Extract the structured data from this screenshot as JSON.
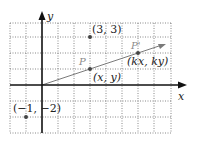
{
  "diagram": {
    "type": "coordinate-plane",
    "axes": {
      "x_label": "x",
      "y_label": "y"
    },
    "grid": {
      "x_range": [
        -2,
        8
      ],
      "y_range": [
        -3,
        4
      ],
      "style": "dotted"
    },
    "points": [
      {
        "name": "point-3-3",
        "coords": [
          3,
          3
        ],
        "label": "(3, 3)"
      },
      {
        "name": "point-P",
        "coords": [
          3,
          1
        ],
        "label": "(x, y)",
        "tag": "P"
      },
      {
        "name": "point-P-prime",
        "coords": [
          6,
          2
        ],
        "label": "(kx, ky)",
        "tag": "P'"
      },
      {
        "name": "point-neg1-neg2",
        "coords": [
          -1,
          -2
        ],
        "label": "(−1, −2)"
      }
    ],
    "ray": {
      "from": [
        0,
        0
      ],
      "through": [
        3,
        1
      ],
      "to": [
        9,
        3
      ]
    },
    "colors": {
      "grid": "#555555",
      "axis": "#111111",
      "ray": "#7a7a7a",
      "point": "#444444"
    }
  }
}
